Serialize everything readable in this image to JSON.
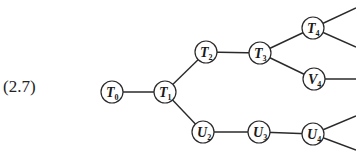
{
  "equation_label": "(2.7)",
  "nodes": [
    {
      "id": "T0",
      "letter": "T",
      "sub": "0",
      "x": 112,
      "y": 92
    },
    {
      "id": "T1",
      "letter": "T",
      "sub": "1",
      "x": 165,
      "y": 92
    },
    {
      "id": "T2",
      "letter": "T",
      "sub": "2",
      "x": 206,
      "y": 52
    },
    {
      "id": "T3",
      "letter": "T",
      "sub": "3",
      "x": 260,
      "y": 53
    },
    {
      "id": "T4",
      "letter": "T",
      "sub": "4",
      "x": 313,
      "y": 28
    },
    {
      "id": "V4",
      "letter": "V",
      "sub": "4",
      "x": 314,
      "y": 79
    },
    {
      "id": "U2",
      "letter": "U",
      "sub": "2",
      "x": 203,
      "y": 132
    },
    {
      "id": "U3",
      "letter": "U",
      "sub": "3",
      "x": 259,
      "y": 132
    },
    {
      "id": "U4",
      "letter": "U",
      "sub": "4",
      "x": 313,
      "y": 134
    }
  ],
  "edges": [
    [
      "T0",
      "T1"
    ],
    [
      "T1",
      "T2"
    ],
    [
      "T1",
      "U2"
    ],
    [
      "T2",
      "T3"
    ],
    [
      "T3",
      "T4"
    ],
    [
      "T3",
      "V4"
    ],
    [
      "U2",
      "U3"
    ],
    [
      "U3",
      "U4"
    ]
  ],
  "open_edges": [
    {
      "from": "T4",
      "to": [
        356,
        8
      ]
    },
    {
      "from": "T4",
      "to": [
        356,
        47
      ]
    },
    {
      "from": "V4",
      "to": [
        356,
        79
      ]
    },
    {
      "from": "U4",
      "to": [
        356,
        116
      ]
    },
    {
      "from": "U4",
      "to": [
        356,
        150
      ]
    }
  ]
}
